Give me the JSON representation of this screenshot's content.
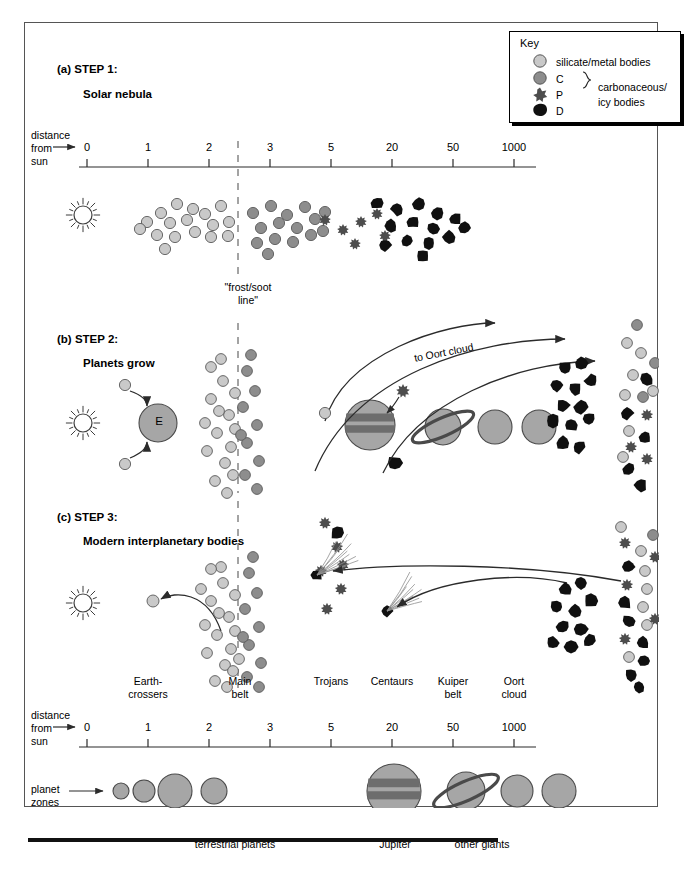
{
  "figure": {
    "key": {
      "title": "Key",
      "entries": [
        {
          "symbol": "silicate-circle",
          "label": "silicate/metal bodies"
        },
        {
          "symbol": "c-circle",
          "label": "C"
        },
        {
          "symbol": "p-star",
          "label": "P"
        },
        {
          "symbol": "d-blob",
          "label": "D"
        }
      ],
      "group_label": "carbonaceous/\nicy bodies",
      "group_label_line1": "carbonaceous/",
      "group_label_line2": "icy bodies"
    },
    "steps": [
      {
        "tag": "(a) STEP 1:",
        "subtitle": "Solar nebula"
      },
      {
        "tag": "(b) STEP 2:",
        "subtitle": "Planets grow"
      },
      {
        "tag": "(c) STEP 3:",
        "subtitle": "Modern interplanetary bodies"
      }
    ],
    "axis": {
      "label_line1": "distance",
      "label_line2": "from",
      "label_line3": "sun",
      "ticks": [
        "0",
        "1",
        "2",
        "3",
        "5",
        "20",
        "50",
        "1000"
      ],
      "tick_px": [
        62,
        123,
        184,
        245,
        306,
        367,
        428,
        489
      ]
    },
    "frost_line": {
      "line1": "\"frost/soot",
      "line2": "line\""
    },
    "annotations": {
      "oort_arrow_label": "to Oort cloud",
      "earth_label": "E"
    },
    "zones": [
      {
        "label_line1": "Earth-",
        "label_line2": "crossers",
        "x": 123
      },
      {
        "label_line1": "Main",
        "label_line2": "belt",
        "x": 215
      },
      {
        "label_line1": "Trojans",
        "label_line2": "",
        "x": 306
      },
      {
        "label_line1": "Centaurs",
        "label_line2": "",
        "x": 367
      },
      {
        "label_line1": "Kuiper",
        "label_line2": "belt",
        "x": 428
      },
      {
        "label_line1": "Oort",
        "label_line2": "cloud",
        "x": 489
      }
    ],
    "planet_zones": {
      "row_label_line1": "planet",
      "row_label_line2": "zones",
      "groups": [
        {
          "label": "terrestrial planets"
        },
        {
          "label": "Jupiter"
        },
        {
          "label": "other giants"
        }
      ]
    },
    "colors": {
      "silicate": "#c9c9c9",
      "c_type": "#8d8d8d",
      "p_type": "#4d4d4d",
      "d_type": "#101010",
      "planet": "#a6a6a6",
      "band": "#6d6d6d",
      "stroke": "#3a3a3a",
      "dash": "#9a9a9a"
    }
  },
  "chart_data": {
    "type": "diagram",
    "xlabel": "distance from sun (AU)",
    "x_ticks": [
      0,
      1,
      2,
      3,
      5,
      20,
      50,
      1000
    ],
    "frost_line_au": 2.5,
    "panels": [
      {
        "name": "STEP 1: Solar nebula",
        "description": "Uniform swarm of planetesimals; composition grades from silicate/metal inside the frost/soot line to C, P and D type carbonaceous/icy bodies outward.",
        "populations": [
          {
            "type": "silicate",
            "range_au": [
              0.7,
              2.5
            ],
            "count": 17
          },
          {
            "type": "C",
            "range_au": [
              2.5,
              5
            ],
            "count": 15
          },
          {
            "type": "P",
            "range_au": [
              3.5,
              8
            ],
            "count": 6
          },
          {
            "type": "D",
            "range_au": [
              5,
              40
            ],
            "count": 14
          }
        ]
      },
      {
        "name": "STEP 2: Planets grow",
        "description": "Planetesimals accrete into planets; Earth (E) grows inside the frost line, giant planets scatter icy bodies outward to the Oort cloud.",
        "populations": [
          {
            "type": "silicate",
            "range_au": [
              2,
              3
            ],
            "count": 16
          },
          {
            "type": "C",
            "range_au": [
              2.5,
              3.2
            ],
            "count": 10
          },
          {
            "type": "D",
            "range_au": [
              40,
              60
            ],
            "count": 12
          },
          {
            "type": "mixed",
            "range_au": [
              800,
              1200
            ],
            "count": 18
          }
        ],
        "ejection_arrows": 3
      },
      {
        "name": "STEP 3: Modern interplanetary bodies",
        "description": "Main belt supplies Earth-crossers; Kuiper belt and Oort cloud supply comets with tails.",
        "populations": [
          {
            "type": "silicate",
            "range_au": [
              2,
              3
            ],
            "count": 18
          },
          {
            "type": "P",
            "range_au": [
              4.5,
              6
            ],
            "count": 6
          },
          {
            "type": "D",
            "range_au": [
              40,
              60
            ],
            "count": 10
          },
          {
            "type": "mixed",
            "range_au": [
              800,
              1200
            ],
            "count": 20
          }
        ],
        "comets": 2
      }
    ],
    "planet_zones": {
      "terrestrial": 4,
      "jupiter": 1,
      "other_giants": 3
    }
  }
}
